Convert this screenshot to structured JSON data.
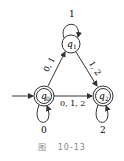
{
  "diagram": {
    "type": "finite-automaton",
    "states": [
      {
        "id": "q0",
        "label_main": "q",
        "label_sub": "0",
        "start": true,
        "accepting": true
      },
      {
        "id": "q1",
        "label_main": "q",
        "label_sub": "1",
        "start": false,
        "accepting": false
      },
      {
        "id": "q2",
        "label_main": "q",
        "label_sub": "2",
        "start": false,
        "accepting": true
      }
    ],
    "transitions": [
      {
        "from": "q0",
        "to": "q0",
        "label": "0"
      },
      {
        "from": "q0",
        "to": "q1",
        "label": "0, 1"
      },
      {
        "from": "q0",
        "to": "q2",
        "label": "0, 1, 2"
      },
      {
        "from": "q1",
        "to": "q1",
        "label": "1"
      },
      {
        "from": "q1",
        "to": "q2",
        "label": "1, 2"
      },
      {
        "from": "q2",
        "to": "q2",
        "label": "2"
      }
    ],
    "caption": {
      "prefix": "图",
      "number": "10-13"
    }
  },
  "colors": {
    "stroke": "#333333",
    "caption": "#888888"
  }
}
